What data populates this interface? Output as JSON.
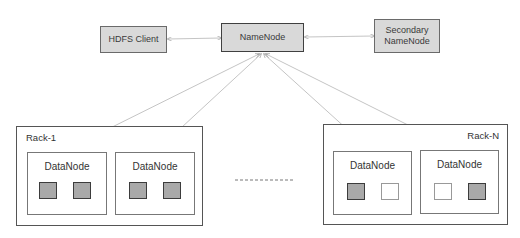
{
  "diagram": {
    "nodes": {
      "hdfs_client": "HDFS Client",
      "namenode": "NameNode",
      "secondary_namenode_line1": "Secondary",
      "secondary_namenode_line2": "NameNode"
    },
    "racks": [
      {
        "label": "Rack-1",
        "datanodes": [
          {
            "label": "DataNode",
            "blocks": [
              "filled",
              "filled"
            ]
          },
          {
            "label": "DataNode",
            "blocks": [
              "filled",
              "filled"
            ]
          }
        ]
      },
      {
        "label": "Rack-N",
        "datanodes": [
          {
            "label": "DataNode",
            "blocks": [
              "filled",
              "empty"
            ]
          },
          {
            "label": "DataNode",
            "blocks": [
              "empty",
              "filled"
            ]
          }
        ]
      }
    ],
    "ellipsis": "- - - - - - - - -",
    "edges": [
      {
        "from": "HDFS Client",
        "to": "NameNode",
        "type": "bidirectional"
      },
      {
        "from": "NameNode",
        "to": "Secondary NameNode",
        "type": "bidirectional"
      },
      {
        "from": "NameNode",
        "to": "Rack-1 DataNode 1",
        "type": "bidirectional"
      },
      {
        "from": "NameNode",
        "to": "Rack-1 DataNode 2",
        "type": "bidirectional"
      },
      {
        "from": "NameNode",
        "to": "Rack-N DataNode 1",
        "type": "bidirectional"
      },
      {
        "from": "NameNode",
        "to": "Rack-N DataNode 2",
        "type": "bidirectional"
      }
    ],
    "colors": {
      "server_fill": "#d9d9d9",
      "block_filled": "#a9a9a9",
      "line": "#b5b5b5"
    }
  }
}
